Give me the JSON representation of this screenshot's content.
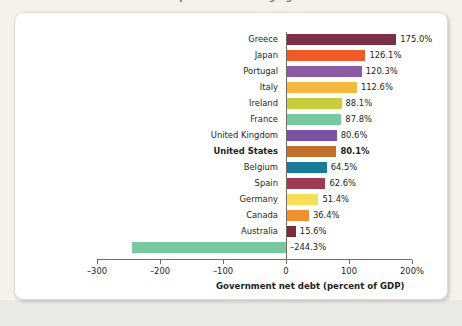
{
  "figure": {
    "title": "International comparison of average government debt",
    "panel_background": "#ffffff",
    "page_background": "#f4f2e9"
  },
  "chart_data": {
    "type": "bar",
    "orientation": "horizontal",
    "title": "",
    "xlabel": "Government net debt (percent of GDP)",
    "ylabel": "",
    "xlim": [
      -300,
      200
    ],
    "grid": false,
    "legend": "none",
    "xticks": [
      -300,
      -200,
      -100,
      0,
      100,
      200
    ],
    "xticklabels": [
      "–300",
      "–200",
      "–100",
      "0",
      "100",
      "200%"
    ],
    "categories": [
      "Greece",
      "Japan",
      "Portugal",
      "Italy",
      "Ireland",
      "France",
      "United Kingdom",
      "United States",
      "Belgium",
      "Spain",
      "Germany",
      "Canada",
      "Australia",
      "Norway"
    ],
    "values": [
      175.0,
      126.1,
      120.3,
      112.6,
      88.1,
      87.8,
      80.6,
      80.1,
      64.5,
      62.6,
      51.4,
      36.4,
      15.6,
      -244.3
    ],
    "value_labels": [
      "175.0%",
      "126.1%",
      "120.3%",
      "112.6%",
      "88.1%",
      "87.8%",
      "80.6%",
      "80.1%",
      "64.5%",
      "62.6%",
      "51.4%",
      "36.4%",
      "15.6%",
      "–244.3%"
    ],
    "colors": [
      "#7b3048",
      "#f05a28",
      "#8b5ca6",
      "#f5b942",
      "#c8cd3c",
      "#79c9a0",
      "#7b52a1",
      "#c1712b",
      "#1a7b96",
      "#9c3b53",
      "#f6de57",
      "#f0912f",
      "#7b2a3c",
      "#79c9a0"
    ],
    "highlight_category": "United States"
  }
}
